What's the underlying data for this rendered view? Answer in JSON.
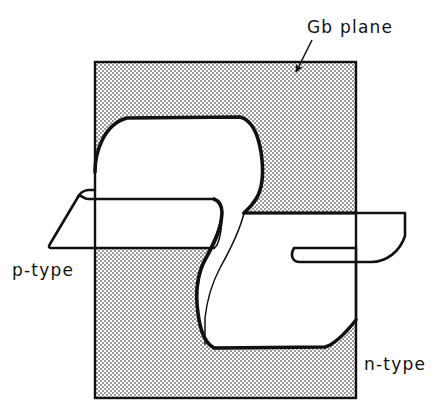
{
  "figure": {
    "background_color": "#ffffff",
    "ink_color": "#111111",
    "shading_color": "#c9c9c9",
    "labels": {
      "gb_plane": "Gb plane",
      "p_type": "p-type",
      "n_type": "n-type"
    },
    "annotations": {
      "leader_line": "arrow from the Gb plane label to the shaded plane",
      "arrowhead_target": "interior of shaded grain boundary plane"
    },
    "geometry": {
      "gb_plane_rect": {
        "x": 95,
        "y": 62,
        "width": 261,
        "height": 336
      },
      "junction_surface": "S-shaped folded sheet crossing the Gb plane",
      "left_wing": "p-type region, upper flat sheet on the left",
      "right_wing": "n-type region, lower flat sheet on the right"
    }
  }
}
